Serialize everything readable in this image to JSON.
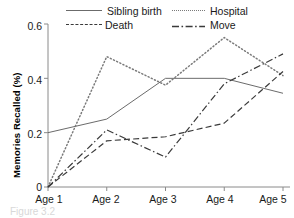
{
  "figure": {
    "caption": "Figure 3.2"
  },
  "chart_data": {
    "type": "line",
    "title": "",
    "xlabel": "",
    "ylabel": "Memories Recalled (%)",
    "categories": [
      "Age 1",
      "Age 2",
      "Age 3",
      "Age 4",
      "Age 5"
    ],
    "ylim": [
      0,
      0.6
    ],
    "yticks": [
      "0",
      "0.2",
      "0.4",
      "0.6"
    ],
    "ytick_values": [
      0,
      0.2,
      0.4,
      0.6
    ],
    "grid": false,
    "legend_position": "top",
    "series": [
      {
        "name": "Sibling birth",
        "style": "solid",
        "color": "#6b6b6b",
        "values": [
          0.2,
          0.25,
          0.4,
          0.4,
          0.345
        ]
      },
      {
        "name": "Hospital",
        "style": "dotted",
        "color": "#7a7a7a",
        "values": [
          0.0,
          0.48,
          0.375,
          0.55,
          0.41
        ]
      },
      {
        "name": "Death",
        "style": "dashed",
        "color": "#3a3a3a",
        "values": [
          0.0,
          0.17,
          0.185,
          0.235,
          0.425
        ]
      },
      {
        "name": "Move",
        "style": "dashdot",
        "color": "#3a3a3a",
        "values": [
          0.0,
          0.21,
          0.11,
          0.38,
          0.49
        ]
      }
    ]
  },
  "axis": {
    "color": "#8a8a8a"
  }
}
